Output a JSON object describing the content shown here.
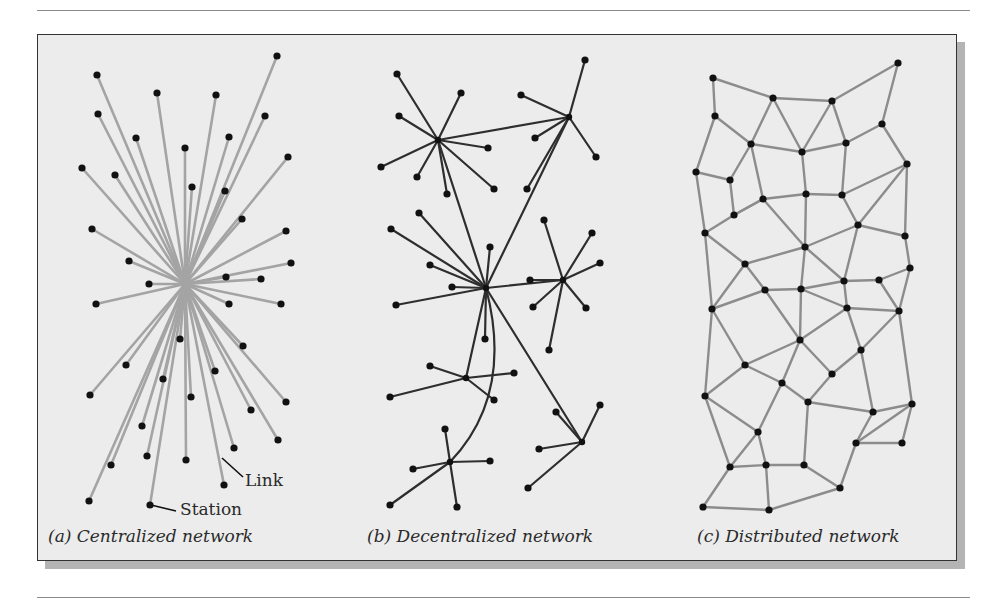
{
  "figure": {
    "captions": {
      "a": "(a) Centralized network",
      "b": "(b) Decentralized network",
      "c": "(c) Distributed network"
    },
    "annotations": {
      "link": "Link",
      "station": "Station"
    },
    "colors": {
      "background": "#ececec",
      "frame_border": "#333333",
      "shadow": "#b4b4b4",
      "node": "#111111",
      "centralized_link": "#a4a4a4",
      "decentralized_link": "#2e2e2e",
      "distributed_link": "#8c8c8c"
    }
  },
  "centralized": {
    "hub": [
      185,
      284
    ],
    "nodes": [
      [
        97,
        75
      ],
      [
        277,
        56
      ],
      [
        157,
        93
      ],
      [
        216,
        95
      ],
      [
        98,
        114
      ],
      [
        265,
        116
      ],
      [
        136,
        138
      ],
      [
        229,
        137
      ],
      [
        185,
        148
      ],
      [
        82,
        168
      ],
      [
        115,
        175
      ],
      [
        192,
        187
      ],
      [
        288,
        157
      ],
      [
        225,
        191
      ],
      [
        242,
        219
      ],
      [
        92,
        229
      ],
      [
        286,
        231
      ],
      [
        129,
        261
      ],
      [
        291,
        263
      ],
      [
        149,
        284
      ],
      [
        226,
        277
      ],
      [
        261,
        279
      ],
      [
        229,
        304
      ],
      [
        281,
        304
      ],
      [
        96,
        304
      ],
      [
        180,
        339
      ],
      [
        243,
        346
      ],
      [
        126,
        365
      ],
      [
        163,
        379
      ],
      [
        215,
        371
      ],
      [
        191,
        397
      ],
      [
        90,
        395
      ],
      [
        251,
        410
      ],
      [
        286,
        402
      ],
      [
        142,
        426
      ],
      [
        147,
        456
      ],
      [
        234,
        448
      ],
      [
        186,
        460
      ],
      [
        111,
        465
      ],
      [
        278,
        440
      ],
      [
        224,
        485
      ],
      [
        89,
        501
      ],
      [
        150,
        505
      ]
    ]
  },
  "decentralized": {
    "hubs": {
      "A": [
        438,
        140
      ],
      "B": [
        569,
        117
      ],
      "C": [
        486,
        288
      ],
      "D": [
        563,
        280
      ],
      "E": [
        466,
        378
      ],
      "F": [
        450,
        462
      ],
      "G": [
        582,
        442
      ]
    },
    "leaves": [
      [
        "A",
        [
          397,
          74
        ]
      ],
      [
        "A",
        [
          461,
          93
        ]
      ],
      [
        "A",
        [
          399,
          116
        ]
      ],
      [
        "A",
        [
          381,
          167
        ]
      ],
      [
        "A",
        [
          417,
          177
        ]
      ],
      [
        "A",
        [
          488,
          148
        ]
      ],
      [
        "A",
        [
          494,
          189
        ]
      ],
      [
        "A",
        [
          447,
          194
        ]
      ],
      [
        "B",
        [
          585,
          60
        ]
      ],
      [
        "B",
        [
          521,
          95
        ]
      ],
      [
        "B",
        [
          535,
          138
        ]
      ],
      [
        "B",
        [
          596,
          157
        ]
      ],
      [
        "B",
        [
          527,
          189
        ]
      ],
      [
        "C",
        [
          419,
          213
        ]
      ],
      [
        "C",
        [
          391,
          229
        ]
      ],
      [
        "C",
        [
          430,
          265
        ]
      ],
      [
        "C",
        [
          452,
          287
        ]
      ],
      [
        "C",
        [
          396,
          305
        ]
      ],
      [
        "C",
        [
          490,
          247
        ]
      ],
      [
        "C",
        [
          485,
          339
        ]
      ],
      [
        "D",
        [
          544,
          220
        ]
      ],
      [
        "D",
        [
          592,
          233
        ]
      ],
      [
        "D",
        [
          600,
          263
        ]
      ],
      [
        "D",
        [
          530,
          280
        ]
      ],
      [
        "D",
        [
          533,
          307
        ]
      ],
      [
        "D",
        [
          586,
          308
        ]
      ],
      [
        "D",
        [
          549,
          350
        ]
      ],
      [
        "E",
        [
          430,
          366
        ]
      ],
      [
        "E",
        [
          514,
          373
        ]
      ],
      [
        "E",
        [
          390,
          397
        ]
      ],
      [
        "E",
        [
          494,
          400
        ]
      ],
      [
        "F",
        [
          445,
          429
        ]
      ],
      [
        "F",
        [
          413,
          469
        ]
      ],
      [
        "F",
        [
          490,
          461
        ]
      ],
      [
        "F",
        [
          390,
          505
        ]
      ],
      [
        "F",
        [
          457,
          507
        ]
      ],
      [
        "G",
        [
          556,
          412
        ]
      ],
      [
        "G",
        [
          600,
          405
        ]
      ],
      [
        "G",
        [
          539,
          449
        ]
      ],
      [
        "G",
        [
          528,
          488
        ]
      ]
    ],
    "hub_links": [
      [
        "A",
        "B"
      ],
      [
        "A",
        "C"
      ],
      [
        "B",
        "C"
      ],
      [
        "C",
        "D"
      ],
      [
        "C",
        "E"
      ],
      [
        "C",
        "G"
      ]
    ],
    "curved_links": [
      [
        "C",
        "F"
      ]
    ]
  },
  "distributed": {
    "nodes": [
      [
        713,
        78
      ],
      [
        773,
        98
      ],
      [
        832,
        101
      ],
      [
        898,
        63
      ],
      [
        715,
        116
      ],
      [
        751,
        144
      ],
      [
        802,
        152
      ],
      [
        846,
        143
      ],
      [
        882,
        124
      ],
      [
        696,
        172
      ],
      [
        730,
        180
      ],
      [
        763,
        199
      ],
      [
        806,
        194
      ],
      [
        842,
        195
      ],
      [
        907,
        164
      ],
      [
        705,
        233
      ],
      [
        745,
        264
      ],
      [
        805,
        247
      ],
      [
        858,
        225
      ],
      [
        905,
        236
      ],
      [
        910,
        268
      ],
      [
        765,
        290
      ],
      [
        801,
        289
      ],
      [
        844,
        281
      ],
      [
        879,
        280
      ],
      [
        712,
        309
      ],
      [
        847,
        308
      ],
      [
        899,
        311
      ],
      [
        800,
        340
      ],
      [
        861,
        350
      ],
      [
        745,
        365
      ],
      [
        782,
        383
      ],
      [
        808,
        402
      ],
      [
        832,
        374
      ],
      [
        705,
        396
      ],
      [
        758,
        432
      ],
      [
        873,
        412
      ],
      [
        912,
        404
      ],
      [
        856,
        443
      ],
      [
        730,
        467
      ],
      [
        766,
        465
      ],
      [
        804,
        465
      ],
      [
        840,
        488
      ],
      [
        902,
        443
      ],
      [
        703,
        507
      ],
      [
        769,
        510
      ],
      [
        734,
        215
      ]
    ],
    "edges": [
      [
        0,
        1
      ],
      [
        1,
        2
      ],
      [
        2,
        3
      ],
      [
        0,
        4
      ],
      [
        4,
        5
      ],
      [
        1,
        5
      ],
      [
        1,
        6
      ],
      [
        2,
        6
      ],
      [
        2,
        7
      ],
      [
        3,
        8
      ],
      [
        7,
        8
      ],
      [
        5,
        6
      ],
      [
        6,
        7
      ],
      [
        4,
        9
      ],
      [
        9,
        10
      ],
      [
        5,
        10
      ],
      [
        10,
        46
      ],
      [
        5,
        11
      ],
      [
        46,
        11
      ],
      [
        11,
        12
      ],
      [
        6,
        12
      ],
      [
        12,
        13
      ],
      [
        7,
        13
      ],
      [
        8,
        14
      ],
      [
        13,
        14
      ],
      [
        9,
        15
      ],
      [
        15,
        46
      ],
      [
        46,
        11
      ],
      [
        11,
        17
      ],
      [
        12,
        17
      ],
      [
        13,
        18
      ],
      [
        14,
        18
      ],
      [
        14,
        19
      ],
      [
        18,
        19
      ],
      [
        19,
        20
      ],
      [
        15,
        16
      ],
      [
        16,
        17
      ],
      [
        17,
        18
      ],
      [
        16,
        21
      ],
      [
        15,
        25
      ],
      [
        16,
        25
      ],
      [
        17,
        22
      ],
      [
        21,
        22
      ],
      [
        22,
        23
      ],
      [
        18,
        23
      ],
      [
        23,
        24
      ],
      [
        20,
        24
      ],
      [
        24,
        27
      ],
      [
        20,
        27
      ],
      [
        17,
        23
      ],
      [
        23,
        26
      ],
      [
        22,
        26
      ],
      [
        26,
        27
      ],
      [
        21,
        25
      ],
      [
        21,
        28
      ],
      [
        22,
        28
      ],
      [
        26,
        28
      ],
      [
        26,
        29
      ],
      [
        27,
        29
      ],
      [
        28,
        30
      ],
      [
        25,
        30
      ],
      [
        30,
        31
      ],
      [
        28,
        31
      ],
      [
        31,
        32
      ],
      [
        32,
        33
      ],
      [
        28,
        33
      ],
      [
        33,
        29
      ],
      [
        29,
        36
      ],
      [
        32,
        36
      ],
      [
        36,
        37
      ],
      [
        27,
        37
      ],
      [
        36,
        38
      ],
      [
        37,
        38
      ],
      [
        25,
        34
      ],
      [
        30,
        34
      ],
      [
        34,
        35
      ],
      [
        31,
        35
      ],
      [
        35,
        39
      ],
      [
        34,
        39
      ],
      [
        35,
        40
      ],
      [
        39,
        40
      ],
      [
        40,
        41
      ],
      [
        41,
        42
      ],
      [
        32,
        41
      ],
      [
        42,
        38
      ],
      [
        38,
        43
      ],
      [
        37,
        43
      ],
      [
        39,
        44
      ],
      [
        44,
        45
      ],
      [
        40,
        45
      ],
      [
        42,
        45
      ]
    ]
  }
}
